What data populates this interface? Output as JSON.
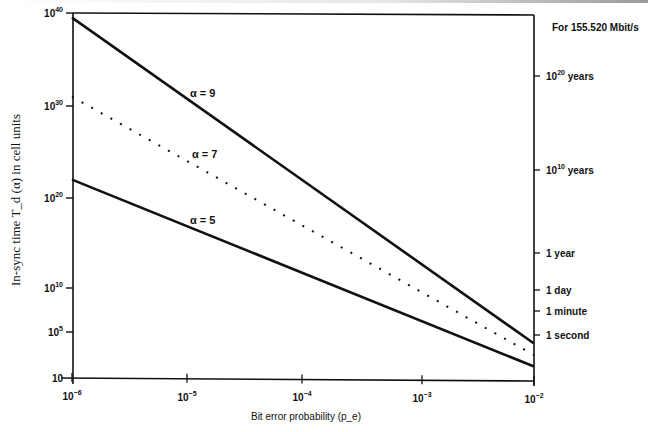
{
  "chart_data": {
    "type": "line",
    "title": "",
    "annotation_top_right": "For 155.520 Mbit/s",
    "xlabel": "Bit error probability (p_e)",
    "ylabel": "In-sync time T_d (α) in cell units",
    "x_scale": "log",
    "y_scale": "log",
    "xlim": [
      1e-06,
      0.01
    ],
    "ylim": [
      10,
      1e+40
    ],
    "x_ticks": [
      {
        "value": 1e-06,
        "base": "10",
        "exp": "−6"
      },
      {
        "value": 1e-05,
        "base": "10",
        "exp": "−5"
      },
      {
        "value": 0.0001,
        "base": "10",
        "exp": "−4"
      },
      {
        "value": 0.001,
        "base": "10",
        "exp": "−3"
      },
      {
        "value": 0.01,
        "base": "10",
        "exp": "−2"
      }
    ],
    "y_ticks": [
      {
        "log10": 40,
        "base": "10",
        "exp": "40"
      },
      {
        "log10": 30,
        "base": "10",
        "exp": "30"
      },
      {
        "log10": 20,
        "base": "10",
        "exp": "20"
      },
      {
        "log10": 10,
        "base": "10",
        "exp": "10"
      },
      {
        "log10": 5,
        "base": "10",
        "exp": "5"
      },
      {
        "log10": 1,
        "base": "10",
        "exp": ""
      }
    ],
    "right_axis_ticks": [
      {
        "label_base": "10",
        "label_exp": "20",
        "label_suffix": " years",
        "y_px": 76
      },
      {
        "label_base": "10",
        "label_exp": "10",
        "label_suffix": " years",
        "y_px": 170
      },
      {
        "label_base": "1 year",
        "label_exp": "",
        "label_suffix": "",
        "y_px": 253
      },
      {
        "label_base": "1 day",
        "label_exp": "",
        "label_suffix": "",
        "y_px": 290
      },
      {
        "label_base": "1 minute",
        "label_exp": "",
        "label_suffix": "",
        "y_px": 311
      },
      {
        "label_base": "1 second",
        "label_exp": "",
        "label_suffix": "",
        "y_px": 335
      }
    ],
    "x": [
      1e-06,
      0.01
    ],
    "series": [
      {
        "name": "α = 9",
        "style": "solid",
        "log10_values": [
          39.5,
          4.0
        ],
        "label_pos": {
          "x": 190,
          "y": 97
        }
      },
      {
        "name": "α = 7",
        "style": "dotted",
        "log10_values": [
          31.0,
          3.0
        ],
        "label_pos": {
          "x": 192,
          "y": 158
        }
      },
      {
        "name": "α = 5",
        "style": "solid",
        "log10_values": [
          22.0,
          2.0
        ],
        "label_pos": {
          "x": 190,
          "y": 224
        }
      }
    ],
    "grid": false,
    "legend": "inline labels"
  }
}
